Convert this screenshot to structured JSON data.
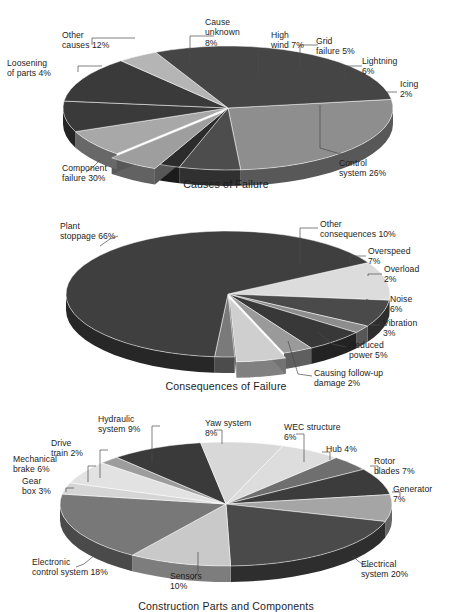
{
  "figure": {
    "background": "#ffffff",
    "ink": "#1d1d1d"
  },
  "charts": [
    {
      "id": "causes-of-failure",
      "title": "Causes of Failure",
      "labels": {
        "other_causes": "Other\ncauses 12%",
        "loosening": "Loosening\nof parts 4%",
        "component_failure": "Component\nfailure 30%",
        "cause_unknown": "Cause\nunknown\n8%",
        "high_wind": "High\nwind 7%",
        "grid_failure": "Grid\nfailure 5%",
        "lightning": "Lightning\n6%",
        "icing": "Icing\n2%",
        "control_system": "Control\nsystem 26%"
      }
    },
    {
      "id": "consequences-of-failure",
      "title": "Consequences of Failure",
      "labels": {
        "plant_stoppage": "Plant\nstoppage 66%",
        "other_consequences": "Other\nconsequences 10%",
        "overspeed": "Overspeed\n7%",
        "overload": "Overload\n2%",
        "noise": "Noise\n6%",
        "vibration": "Vibration\n3%",
        "reduced_power": "Reduced\npower 5%",
        "follow_up": "Causing follow-up\ndamage 2%"
      }
    },
    {
      "id": "construction-parts-and-components",
      "title": "Construction Parts and Components",
      "labels": {
        "hydraulic": "Hydraulic\nsystem 9%",
        "drive_train": "Drive\ntrain 2%",
        "mechanical_brake": "Mechanical\nbrake 6%",
        "gear_box": "Gear\nbox 3%",
        "electronic_control": "Electronic\ncontrol system 18%",
        "sensors": "Sensors\n10%",
        "yaw_system": "Yaw system\n8%",
        "wec_structure": "WEC structure\n6%",
        "hub": "Hub 4%",
        "rotor_blades": "Rotor\nblades 7%",
        "generator": "Generator\n7%",
        "electrical_system": "Electrical\nsystem 20%"
      }
    }
  ],
  "chart_data": [
    {
      "type": "pie",
      "title": "Causes of Failure",
      "categories": [
        "Control system",
        "Lightning",
        "Icing",
        "Grid failure",
        "High wind",
        "Cause unknown",
        "Other causes",
        "Loosening of parts",
        "Component failure"
      ],
      "values": [
        26,
        6,
        2,
        5,
        7,
        8,
        12,
        4,
        30
      ],
      "units": "%",
      "legend": "none",
      "labels_position": "callout-outside",
      "exploded_slices": [
        "Grid failure"
      ],
      "slice_colors": [
        "#8e8e8e",
        "#4d4d4d",
        "#2c2c2c",
        "#9e9e9e",
        "#a8a8a8",
        "#3a3a3a",
        "#3a3a3a",
        "#b5b5b5",
        "#454545"
      ],
      "start_angle_deg": -8,
      "direction": "clockwise"
    },
    {
      "type": "pie",
      "title": "Consequences of Failure",
      "categories": [
        "Other consequences",
        "Overspeed",
        "Overload",
        "Noise",
        "Vibration",
        "Reduced power",
        "Causing follow-up damage",
        "Plant stoppage"
      ],
      "values": [
        10,
        7,
        2,
        6,
        3,
        5,
        2,
        66
      ],
      "units": "%",
      "legend": "none",
      "labels_position": "callout-outside",
      "exploded_slices": [
        "Reduced power"
      ],
      "slice_colors": [
        "#dcdcdc",
        "#4a4a4a",
        "#8d8d8d",
        "#383838",
        "#9a9a9a",
        "#cfcfcf",
        "#7a7a7a",
        "#3f3f3f"
      ],
      "start_angle_deg": -30,
      "direction": "clockwise"
    },
    {
      "type": "pie",
      "title": "Construction Parts and Components",
      "categories": [
        "WEC structure",
        "Hub",
        "Rotor blades",
        "Generator",
        "Electrical system",
        "Sensors",
        "Electronic control system",
        "Gear box",
        "Mechanical brake",
        "Drive train",
        "Hydraulic system",
        "Yaw system"
      ],
      "values": [
        6,
        4,
        7,
        7,
        20,
        10,
        18,
        3,
        6,
        2,
        9,
        8
      ],
      "units": "%",
      "legend": "none",
      "labels_position": "callout-outside",
      "exploded_slices": [],
      "slice_colors": [
        "#dddddd",
        "#6f6f6f",
        "#3c3c3c",
        "#a5a5a5",
        "#4a4a4a",
        "#c9c9c9",
        "#787878",
        "#d5d5d5",
        "#e2e2e2",
        "#9c9c9c",
        "#3a3a3a",
        "#d8d8d8"
      ],
      "start_angle_deg": -70,
      "direction": "clockwise"
    }
  ]
}
